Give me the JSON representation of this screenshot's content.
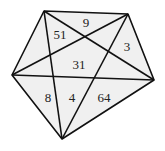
{
  "diagram": {
    "type": "pentagon-with-inscribed-star",
    "colors": {
      "background": "#ffffff",
      "fill": "#f0f0f0",
      "stroke": "#111111",
      "text": "#222222"
    },
    "vertices": [
      {
        "id": "A",
        "x": 44,
        "y": 11
      },
      {
        "id": "B",
        "x": 128,
        "y": 14
      },
      {
        "id": "C",
        "x": 154,
        "y": 80
      },
      {
        "id": "D",
        "x": 62,
        "y": 139
      },
      {
        "id": "E",
        "x": 12,
        "y": 75
      }
    ],
    "labels": [
      {
        "text": "9",
        "x": 86,
        "y": 27
      },
      {
        "text": "51",
        "x": 60,
        "y": 39
      },
      {
        "text": "3",
        "x": 127,
        "y": 51
      },
      {
        "text": "31",
        "x": 79,
        "y": 69
      },
      {
        "text": "8",
        "x": 48,
        "y": 102
      },
      {
        "text": "4",
        "x": 72,
        "y": 102
      },
      {
        "text": "64",
        "x": 104,
        "y": 102
      }
    ]
  }
}
